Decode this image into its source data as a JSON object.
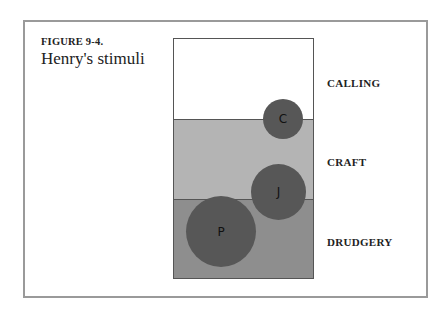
{
  "figure": {
    "number": "FIGURE 9-4.",
    "title": "Henry's stimuli"
  },
  "bands": [
    {
      "name": "CALLING",
      "color": "#ffffff"
    },
    {
      "name": "CRAFT",
      "color": "#b4b4b4"
    },
    {
      "name": "DRUDGERY",
      "color": "#8e8e8e"
    }
  ],
  "bubbles": [
    {
      "label": "C",
      "band": "CALLING/CRAFT boundary",
      "size": "small"
    },
    {
      "label": "J",
      "band": "CRAFT/DRUDGERY boundary",
      "size": "medium"
    },
    {
      "label": "P",
      "band": "DRUDGERY",
      "size": "large"
    }
  ],
  "colors": {
    "bubble": "#575757",
    "frame": "#9a9a9a"
  }
}
